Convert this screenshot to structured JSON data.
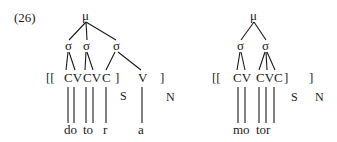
{
  "example_number": "(26)",
  "colors": {
    "ink": "#1a1a1a",
    "background": "#ffffff"
  },
  "tree_left": {
    "root": "μ",
    "syllables": [
      "σ",
      "σ",
      "σ"
    ],
    "open_bracket": "[[",
    "skeleton": [
      "CV",
      "CV",
      "C"
    ],
    "inner_close_bracket": "]",
    "stem_label": "S",
    "extra_slot": "V",
    "outer_close_bracket": "]",
    "word_label": "N",
    "segments": [
      "do",
      "to",
      "r",
      "a"
    ]
  },
  "tree_right": {
    "root": "μ",
    "syllables": [
      "σ",
      "σ"
    ],
    "open_bracket": "[[",
    "skeleton": [
      "CV",
      "CVC"
    ],
    "inner_close_bracket": "]",
    "stem_label": "S",
    "outer_close_bracket": "]",
    "word_label": "N",
    "segments": [
      "mo",
      "tor"
    ]
  }
}
